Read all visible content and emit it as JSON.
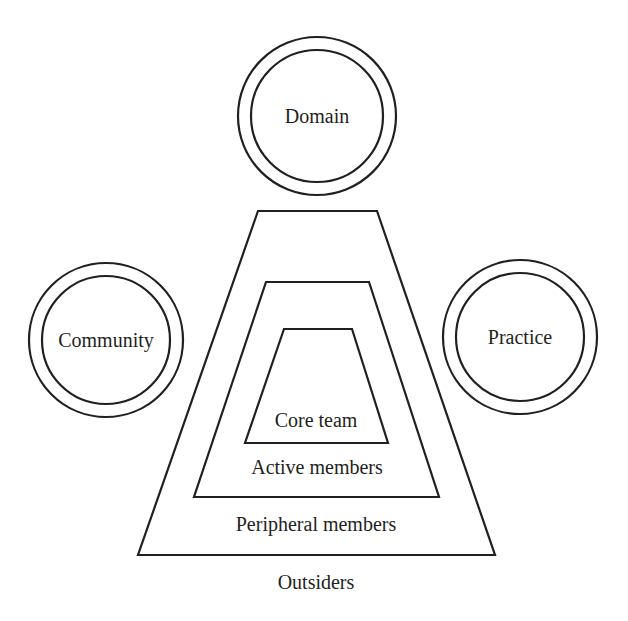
{
  "diagram": {
    "stroke_color": "#231f20",
    "background_color": "#ffffff",
    "circles": [
      {
        "id": "domain",
        "label": "Domain",
        "cx": 317,
        "cy": 116,
        "r_outer": 79,
        "r_inner": 66
      },
      {
        "id": "community",
        "label": "Community",
        "cx": 106,
        "cy": 340,
        "r_outer": 77,
        "r_inner": 64
      },
      {
        "id": "practice",
        "label": "Practice",
        "cx": 520,
        "cy": 337,
        "r_outer": 77,
        "r_inner": 64
      }
    ],
    "layers": [
      {
        "id": "core-team",
        "label": "Core team",
        "points": "284,329 352,329 388,443 245,443"
      },
      {
        "id": "active-members",
        "label": "Active members",
        "points": "266,282 369,282 439,497 194,497"
      },
      {
        "id": "peripheral-members",
        "label": "Peripheral members",
        "points": "258,211 377,211 495,555 138,555"
      }
    ],
    "labels": {
      "domain": "Domain",
      "community": "Community",
      "practice": "Practice",
      "core_team": "Core team",
      "active_members": "Active members",
      "peripheral_members": "Peripheral members",
      "outsiders": "Outsiders"
    }
  }
}
